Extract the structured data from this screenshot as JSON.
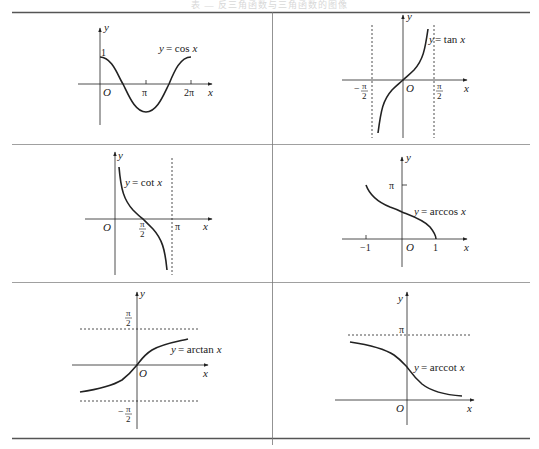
{
  "page": {
    "caption": "表 — 反三角函数与三角函数的图像",
    "layout": "2-column table, 3 rows"
  },
  "cells": [
    {
      "id": "cos",
      "label": "y = cos x",
      "func": "y",
      "eq": "= cos",
      "var": "x",
      "ticks": {
        "y1": "1",
        "pi": "π",
        "two_pi": "2π"
      },
      "origin": "O",
      "x_axis": "x",
      "y_axis": "y"
    },
    {
      "id": "tan",
      "label": "y = tan x",
      "func": "y",
      "eq": "= tan",
      "var": "x",
      "ticks": {
        "neg_half_pi_num": "π",
        "neg_half_pi_den": "2",
        "neg_sign": "−",
        "half_pi_num": "π",
        "half_pi_den": "2"
      },
      "origin": "O",
      "x_axis": "x",
      "y_axis": "y"
    },
    {
      "id": "cot",
      "label": "y = cot x",
      "func": "y",
      "eq": "= cot",
      "var": "x",
      "ticks": {
        "half_pi_num": "π",
        "half_pi_den": "2",
        "pi": "π"
      },
      "origin": "O",
      "x_axis": "x",
      "y_axis": "y"
    },
    {
      "id": "arccos",
      "label": "y = arccos x",
      "func": "y",
      "eq": "= arccos",
      "var": "x",
      "ticks": {
        "neg_one": "−1",
        "one": "1",
        "pi": "π"
      },
      "origin": "O",
      "x_axis": "x",
      "y_axis": "y"
    },
    {
      "id": "arctan",
      "label": "y = arctan x",
      "func": "y",
      "eq": "= arctan",
      "var": "x",
      "ticks": {
        "half_pi_num": "π",
        "half_pi_den": "2",
        "neg_sign": "−",
        "neg_half_pi_num": "π",
        "neg_half_pi_den": "2"
      },
      "origin": "O",
      "x_axis": "x",
      "y_axis": "y"
    },
    {
      "id": "arccot",
      "label": "y = arccot x",
      "func": "y",
      "eq": "= arccot",
      "var": "x",
      "ticks": {
        "pi": "π"
      },
      "origin": "O",
      "x_axis": "x",
      "y_axis": "y"
    }
  ],
  "colors": {
    "ink": "#222222",
    "rule": "#555555",
    "dash": "#444444"
  }
}
